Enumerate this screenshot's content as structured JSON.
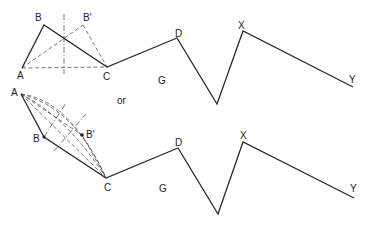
{
  "figure": {
    "connector_text": "or",
    "top": {
      "labels": {
        "A": "A",
        "B": "B",
        "B_prime": "B'",
        "C": "C",
        "D": "D",
        "G": "G",
        "X": "X",
        "Y": "Y"
      },
      "points": {
        "A": [
          22,
          68
        ],
        "B": [
          44,
          25
        ],
        "B_prime": [
          83,
          25
        ],
        "C": [
          107,
          67
        ],
        "D": [
          177,
          38
        ],
        "valley": [
          217,
          104
        ],
        "X": [
          243,
          31
        ],
        "Y": [
          353,
          87
        ]
      }
    },
    "bottom": {
      "labels": {
        "A": "A",
        "B": "B",
        "B_prime": "B'",
        "C": "C",
        "D": "D",
        "G": "G",
        "X": "X",
        "Y": "Y"
      },
      "points": {
        "A": [
          21,
          94
        ],
        "B": [
          44,
          137
        ],
        "B_prime": [
          82,
          135
        ],
        "C": [
          106,
          178
        ],
        "D": [
          178,
          148
        ],
        "valley": [
          218,
          214
        ],
        "X": [
          243,
          142
        ],
        "Y": [
          354,
          198
        ]
      }
    }
  }
}
